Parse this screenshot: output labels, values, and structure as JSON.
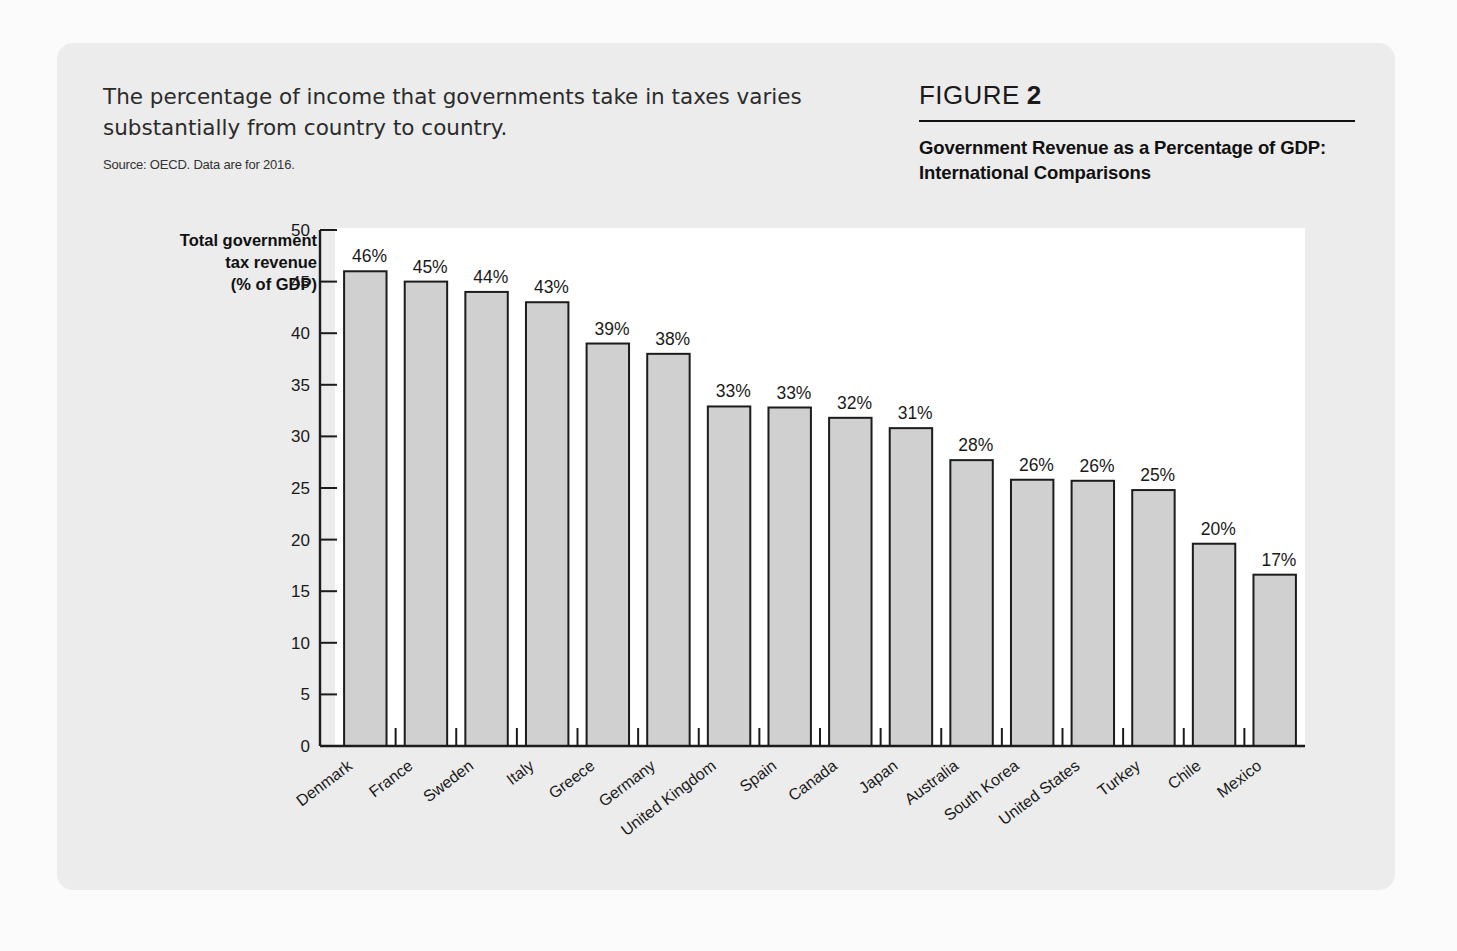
{
  "card": {
    "caption": "The percentage of income that governments take in taxes varies substantially from country to country.",
    "source": "Source: OECD. Data are for 2016.",
    "figure_word": "FIGURE",
    "figure_number": "2",
    "figure_title": "Government Revenue as a Percentage of GDP: International Comparisons"
  },
  "colors": {
    "card_bg": "#ececec",
    "plot_bg": "#ffffff",
    "bar_fill": "#d0d0d0",
    "bar_stroke": "#1c1c1c",
    "text": "#1a1a1a"
  },
  "chart_data": {
    "type": "bar",
    "title": "Government Revenue as a Percentage of GDP: International Comparisons",
    "subtitle": "The percentage of income that governments take in taxes varies substantially from country to country.",
    "source": "Source: OECD. Data are for 2016.",
    "xlabel": "",
    "ylabel": "Total government tax revenue (% of GDP)",
    "ylabel_lines": [
      "Total government",
      "tax revenue",
      "(% of GDP)"
    ],
    "ylim": [
      0,
      50
    ],
    "yticks": [
      0,
      5,
      10,
      15,
      20,
      25,
      30,
      35,
      40,
      45,
      50
    ],
    "ytick_labels": [
      "0",
      "5",
      "10",
      "15",
      "20",
      "25",
      "30",
      "35",
      "40",
      "45",
      "50"
    ],
    "grid": false,
    "legend": false,
    "categories": [
      "Denmark",
      "France",
      "Sweden",
      "Italy",
      "Greece",
      "Germany",
      "United Kingdom",
      "Spain",
      "Canada",
      "Japan",
      "Australia",
      "South Korea",
      "United States",
      "Turkey",
      "Chile",
      "Mexico"
    ],
    "values": [
      46,
      45,
      44,
      43,
      39,
      38,
      33,
      33,
      32,
      31,
      28,
      26,
      26,
      25,
      20,
      17
    ],
    "plotted_values": [
      46,
      45,
      44,
      43,
      39,
      38,
      32.9,
      32.8,
      31.8,
      30.8,
      27.7,
      25.8,
      25.7,
      24.8,
      19.6,
      16.6
    ],
    "data_labels": [
      "46%",
      "45%",
      "44%",
      "43%",
      "39%",
      "38%",
      "33%",
      "33%",
      "32%",
      "31%",
      "28%",
      "26%",
      "26%",
      "25%",
      "20%",
      "17%"
    ]
  }
}
